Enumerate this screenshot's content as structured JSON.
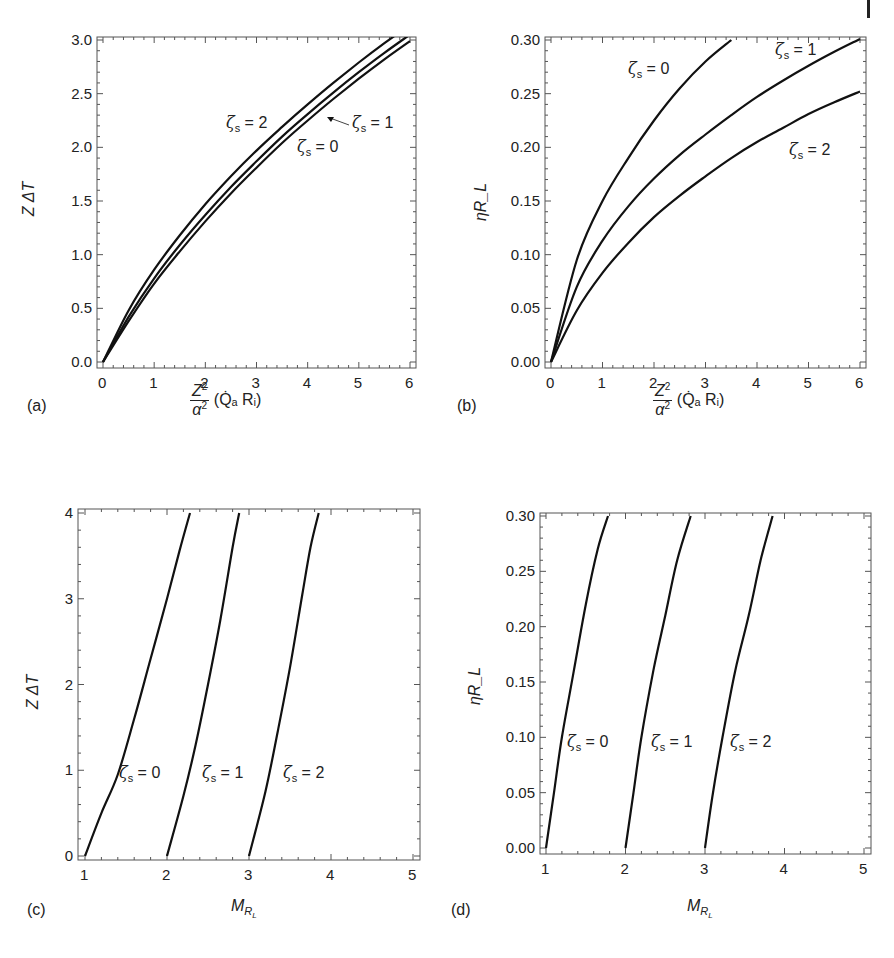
{
  "figure": {
    "panels": [
      {
        "tag": "(a)",
        "ylabel": "Z ΔT",
        "xlabel_num": "Z",
        "xlabel_den": "α",
        "xlabel_tail": "(Q̇ₐ Rᵢ)",
        "xticks": [
          "0",
          "1",
          "2",
          "3",
          "4",
          "5",
          "6"
        ],
        "yticks": [
          "0.0",
          "0.5",
          "1.0",
          "1.5",
          "2.0",
          "2.5",
          "3.0"
        ],
        "annotations": [
          {
            "zeta": "ζ",
            "sub": "s",
            "text": " = 2"
          },
          {
            "zeta": "ζ",
            "sub": "s",
            "text": " = 1"
          },
          {
            "zeta": "ζ",
            "sub": "s",
            "text": " = 0"
          }
        ]
      },
      {
        "tag": "(b)",
        "ylabel": "ηR_L",
        "xlabel_num": "Z",
        "xlabel_den": "α",
        "xlabel_tail": "(Q̇ₐ Rᵢ)",
        "xticks": [
          "0",
          "1",
          "2",
          "3",
          "4",
          "5",
          "6"
        ],
        "yticks": [
          "0.00",
          "0.05",
          "0.10",
          "0.15",
          "0.20",
          "0.25",
          "0.30"
        ],
        "annotations": [
          {
            "zeta": "ζ",
            "sub": "s",
            "text": " = 0"
          },
          {
            "zeta": "ζ",
            "sub": "s",
            "text": " = 1"
          },
          {
            "zeta": "ζ",
            "sub": "s",
            "text": " = 2"
          }
        ]
      },
      {
        "tag": "(c)",
        "ylabel": "Z ΔT",
        "xlabel": "M_R_L",
        "xticks": [
          "1",
          "2",
          "3",
          "4",
          "5"
        ],
        "yticks": [
          "0",
          "1",
          "2",
          "3",
          "4"
        ],
        "annotations": [
          {
            "zeta": "ζ",
            "sub": "s",
            "text": " = 0"
          },
          {
            "zeta": "ζ",
            "sub": "s",
            "text": " = 1"
          },
          {
            "zeta": "ζ",
            "sub": "s",
            "text": " = 2"
          }
        ]
      },
      {
        "tag": "(d)",
        "ylabel": "ηR_L",
        "xlabel": "M_R_L",
        "xticks": [
          "1",
          "2",
          "3",
          "4",
          "5"
        ],
        "yticks": [
          "0.00",
          "0.05",
          "0.10",
          "0.15",
          "0.20",
          "0.25",
          "0.30"
        ],
        "annotations": [
          {
            "zeta": "ζ",
            "sub": "s",
            "text": " = 0"
          },
          {
            "zeta": "ζ",
            "sub": "s",
            "text": " = 1"
          },
          {
            "zeta": "ζ",
            "sub": "s",
            "text": " = 2"
          }
        ]
      }
    ]
  },
  "chart_data": [
    {
      "type": "line",
      "panel": "(a)",
      "title": "",
      "xlabel": "(Z²/α²)(Q̇ₐ Rᵢ)",
      "ylabel": "Z ΔT",
      "xlim": [
        0,
        6
      ],
      "ylim": [
        0,
        3.0
      ],
      "grid": false,
      "legend": "inline annotations",
      "x": [
        0,
        0.5,
        1,
        1.5,
        2,
        2.5,
        3,
        3.5,
        4,
        4.5,
        5,
        5.5,
        6
      ],
      "series": [
        {
          "name": "ζs = 2",
          "values": [
            0,
            0.48,
            0.86,
            1.18,
            1.47,
            1.73,
            1.97,
            2.19,
            2.4,
            2.6,
            2.79,
            2.97,
            3.14
          ]
        },
        {
          "name": "ζs = 1",
          "values": [
            0,
            0.42,
            0.78,
            1.09,
            1.37,
            1.63,
            1.87,
            2.1,
            2.31,
            2.51,
            2.7,
            2.88,
            3.05
          ]
        },
        {
          "name": "ζs = 0",
          "values": [
            0,
            0.38,
            0.73,
            1.03,
            1.31,
            1.57,
            1.81,
            2.04,
            2.25,
            2.45,
            2.64,
            2.82,
            2.99
          ]
        }
      ]
    },
    {
      "type": "line",
      "panel": "(b)",
      "title": "",
      "xlabel": "(Z²/α²)(Q̇ₐ Rᵢ)",
      "ylabel": "ηR_L",
      "xlim": [
        0,
        6
      ],
      "ylim": [
        0,
        0.3
      ],
      "grid": false,
      "legend": "inline annotations",
      "x": [
        0,
        0.5,
        1,
        1.5,
        2,
        2.5,
        3,
        3.5,
        4,
        4.5,
        5,
        5.5,
        6
      ],
      "series": [
        {
          "name": "ζs = 0",
          "values": [
            0,
            0.095,
            0.15,
            0.19,
            0.225,
            0.255,
            0.28,
            0.3,
            null,
            null,
            null,
            null,
            null
          ]
        },
        {
          "name": "ζs = 1",
          "values": [
            0,
            0.07,
            0.113,
            0.145,
            0.171,
            0.193,
            0.212,
            0.23,
            0.247,
            0.262,
            0.276,
            0.289,
            0.301
          ]
        },
        {
          "name": "ζs = 2",
          "values": [
            0,
            0.048,
            0.083,
            0.111,
            0.135,
            0.155,
            0.173,
            0.19,
            0.205,
            0.218,
            0.231,
            0.242,
            0.252
          ]
        }
      ]
    },
    {
      "type": "line",
      "panel": "(c)",
      "title": "",
      "xlabel": "M_R_L",
      "ylabel": "Z ΔT",
      "xlim": [
        1,
        5
      ],
      "ylim": [
        0,
        4
      ],
      "grid": false,
      "legend": "inline annotations",
      "series": [
        {
          "name": "ζs = 0",
          "points": [
            [
              1.0,
              0
            ],
            [
              1.2,
              0.5
            ],
            [
              1.4,
              0.95
            ],
            [
              1.6,
              1.6
            ],
            [
              1.8,
              2.3
            ],
            [
              2.0,
              3.0
            ],
            [
              2.15,
              3.55
            ],
            [
              2.28,
              4.0
            ]
          ]
        },
        {
          "name": "ζs = 1",
          "points": [
            [
              2.0,
              0
            ],
            [
              2.2,
              0.7
            ],
            [
              2.35,
              1.3
            ],
            [
              2.5,
              2.0
            ],
            [
              2.65,
              2.75
            ],
            [
              2.8,
              3.6
            ],
            [
              2.88,
              4.0
            ]
          ]
        },
        {
          "name": "ζs = 2",
          "points": [
            [
              3.0,
              0
            ],
            [
              3.2,
              0.75
            ],
            [
              3.35,
              1.45
            ],
            [
              3.5,
              2.2
            ],
            [
              3.65,
              3.05
            ],
            [
              3.75,
              3.6
            ],
            [
              3.85,
              4.0
            ]
          ]
        }
      ]
    },
    {
      "type": "line",
      "panel": "(d)",
      "title": "",
      "xlabel": "M_R_L",
      "ylabel": "ηR_L",
      "xlim": [
        1,
        5
      ],
      "ylim": [
        0,
        0.3
      ],
      "grid": false,
      "legend": "inline annotations",
      "series": [
        {
          "name": "ζs = 0",
          "points": [
            [
              1.0,
              0
            ],
            [
              1.1,
              0.05
            ],
            [
              1.2,
              0.1
            ],
            [
              1.35,
              0.16
            ],
            [
              1.5,
              0.22
            ],
            [
              1.65,
              0.27
            ],
            [
              1.78,
              0.3
            ]
          ]
        },
        {
          "name": "ζs = 1",
          "points": [
            [
              2.0,
              0
            ],
            [
              2.1,
              0.05
            ],
            [
              2.2,
              0.1
            ],
            [
              2.35,
              0.16
            ],
            [
              2.5,
              0.21
            ],
            [
              2.65,
              0.26
            ],
            [
              2.82,
              0.3
            ]
          ]
        },
        {
          "name": "ζs = 2",
          "points": [
            [
              3.0,
              0
            ],
            [
              3.1,
              0.05
            ],
            [
              3.22,
              0.1
            ],
            [
              3.38,
              0.16
            ],
            [
              3.55,
              0.21
            ],
            [
              3.7,
              0.26
            ],
            [
              3.85,
              0.3
            ]
          ]
        }
      ]
    }
  ]
}
